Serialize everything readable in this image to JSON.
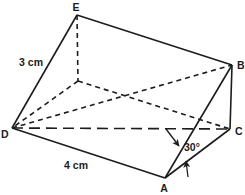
{
  "figure": {
    "canvas": {
      "width": 245,
      "height": 195,
      "background": "#ffffff",
      "line_color": "#1c1c1c",
      "stroke_width": 1.6
    },
    "style": {
      "dash_short": "5,4",
      "dash_long": "11,6"
    },
    "vertices": [
      {
        "id": "E",
        "x": 77,
        "y": 15,
        "label": "E",
        "label_x": 76,
        "label_y": 11,
        "anchor": "middle"
      },
      {
        "id": "B",
        "x": 232,
        "y": 65,
        "label": "B",
        "label_x": 237,
        "label_y": 69,
        "anchor": "start"
      },
      {
        "id": "C",
        "x": 230,
        "y": 129,
        "label": "C",
        "label_x": 235,
        "label_y": 135,
        "anchor": "start"
      },
      {
        "id": "A",
        "x": 165,
        "y": 178,
        "label": "A",
        "label_x": 164,
        "label_y": 192,
        "anchor": "middle"
      },
      {
        "id": "D",
        "x": 12,
        "y": 128,
        "label": "D",
        "label_x": 1,
        "label_y": 138,
        "anchor": "start"
      },
      {
        "id": "F",
        "x": 78,
        "y": 81,
        "label": "",
        "label_x": 0,
        "label_y": 0,
        "anchor": "middle"
      }
    ],
    "edges": [
      {
        "name": "edge-E-B",
        "from": "E",
        "to": "B",
        "style": "solid"
      },
      {
        "name": "edge-E-D",
        "from": "E",
        "to": "D",
        "style": "solid"
      },
      {
        "name": "edge-D-A",
        "from": "D",
        "to": "A",
        "style": "solid"
      },
      {
        "name": "edge-A-B",
        "from": "A",
        "to": "B",
        "style": "solid"
      },
      {
        "name": "edge-A-C",
        "from": "A",
        "to": "C",
        "style": "solid"
      },
      {
        "name": "edge-B-C",
        "from": "B",
        "to": "C",
        "style": "solid"
      },
      {
        "name": "edge-E-F",
        "from": "E",
        "to": "F",
        "style": "dashed"
      },
      {
        "name": "edge-F-D",
        "from": "F",
        "to": "D",
        "style": "dashed"
      },
      {
        "name": "edge-F-C",
        "from": "F",
        "to": "C",
        "style": "dashed"
      },
      {
        "name": "edge-D-B",
        "from": "D",
        "to": "B",
        "style": "dashed"
      },
      {
        "name": "edge-D-C",
        "from": "D",
        "to": "C",
        "style": "longdash"
      }
    ],
    "dimension_labels": [
      {
        "name": "edge-length-ED",
        "text": "3 cm",
        "x": 31,
        "y": 66,
        "anchor": "middle"
      },
      {
        "name": "edge-length-DA",
        "text": "4 cm",
        "x": 76,
        "y": 169,
        "anchor": "middle"
      },
      {
        "name": "angle-value",
        "text": "30°",
        "x": 184,
        "y": 151,
        "anchor": "start"
      }
    ],
    "arrows": [
      {
        "name": "angle-pointer-upper",
        "x1": 166,
        "y1": 129,
        "x2": 179,
        "y2": 146
      },
      {
        "name": "angle-pointer-lower",
        "x1": 188,
        "y1": 177,
        "x2": 186,
        "y2": 161
      }
    ]
  }
}
